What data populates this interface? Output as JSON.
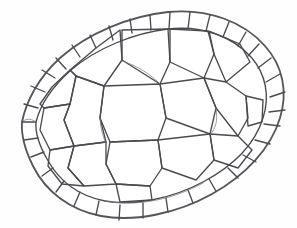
{
  "image": {
    "title": "Turtle shell carapace sketch",
    "subject": "turtle-carapace",
    "medium": "pencil drawing",
    "background_color": "#fefefe",
    "ink_color": "#4a4a4f",
    "outline_color": "#55555b",
    "width": 297,
    "height": 228,
    "caption": ""
  },
  "diagram": {
    "type": "line-drawing",
    "orientation": "dorsal view, pointed end at left",
    "outer_rim": {
      "name": "carapace-outline",
      "path": "M 22 122 C 26 102 38 78 60 58 C 88 33 130 16 168 12 C 208 8 244 22 265 46 C 283 66 288 92 280 118 C 271 148 246 175 212 194 C 176 214 134 222 101 216 C 70 210 46 192 33 166 C 25 150 21 136 22 122 Z"
    },
    "inner_rim": {
      "name": "marginal-inner-boundary",
      "path": "M 36 122 C 40 106 52 87 71 70 C 97 48 134 33 168 29 C 203 25 233 37 251 57 C 266 74 270 96 263 118 C 255 144 233 166 203 182 C 171 199 134 206 105 201 C 79 196 59 181 47 159 C 39 145 35 134 36 122 Z"
    },
    "marginal_scutes": {
      "label": "marginal scutes",
      "count": 27,
      "description": "ring of small quadrilateral plates around the rim"
    },
    "vertebral_scutes": {
      "label": "vertebral scutes",
      "count": 5,
      "description": "central row of large hexagonal plates running along the midline"
    },
    "costal_scutes": {
      "label": "costal scutes",
      "count": 8,
      "description": "four large plates on each flank between the vertebrals and the marginals"
    },
    "nuchal_scute": {
      "label": "nuchal scute",
      "count": 1
    }
  },
  "scute_paths": {
    "inner_plates": [
      "M 120 30 L 122 60 L 104 86 L 76 76 L 70 70 L 96 48 Z",
      "M 122 30 L 168 29 L 170 62 L 160 84 L 122 60 Z",
      "M 170 29 L 208 31 L 214 54 L 204 78 L 170 62 Z",
      "M 209 31 L 240 44 L 250 62 L 226 82 L 214 54 Z",
      "M 70 70 L 76 76 L 70 104 L 44 108 L 40 104 L 52 87 Z",
      "M 104 86 L 160 84 L 166 118 L 158 140 L 110 142 L 100 118 Z",
      "M 160 84 L 204 78 L 216 108 L 210 134 L 166 118 Z",
      "M 204 78 L 226 82 L 246 96 L 248 118 L 238 136 L 216 108 Z",
      "M 76 76 L 104 86 L 100 118 L 106 142 L 74 146 L 64 120 L 70 104 Z",
      "M 44 108 L 70 104 L 64 120 L 74 146 L 50 150 L 40 130 Z",
      "M 110 142 L 158 140 L 162 168 L 150 186 L 116 184 L 106 164 Z",
      "M 158 140 L 210 134 L 214 160 L 196 180 L 162 168 Z",
      "M 210 134 L 238 136 L 252 150 L 238 168 L 214 160 Z",
      "M 74 146 L 106 142 L 106 164 L 116 184 L 84 186 L 68 168 Z",
      "M 50 150 L 74 146 L 68 168 L 84 186 L 62 184 L 48 166 Z",
      "M 116 184 L 150 186 L 152 200 L 120 202 Z",
      "M 246 96 L 263 100 L 262 122 L 248 126 Z"
    ],
    "marginal_spokes": [
      "M 22 122 L 36 122",
      "M 24 104 L 38 108",
      "M 31 86 L 45 92",
      "M 42 70 L 55 78",
      "M 56 58 L 66 69",
      "M 72 45 L 80 57",
      "M 90 35 L 96 48",
      "M 109 26 L 113 40",
      "M 130 19 L 132 33",
      "M 150 15 L 151 30",
      "M 170 12 L 169 29",
      "M 190 12 L 188 29",
      "M 210 15 L 206 31",
      "M 229 22 L 223 37",
      "M 246 32 L 238 46",
      "M 259 44 L 248 56",
      "M 271 58 L 258 68",
      "M 280 74 L 266 82",
      "M 285 92 L 270 97",
      "M 285 110 L 269 112",
      "M 280 126 L 264 124",
      "M 270 144 L 255 140",
      "M 256 162 L 243 155",
      "M 238 178 L 228 168",
      "M 216 191 L 209 179",
      "M 193 203 L 188 190",
      "M 168 212 L 166 198",
      "M 143 218 L 143 203",
      "M 119 220 L 120 205",
      "M 96 215 L 99 201",
      "M 74 206 L 80 192",
      "M 56 192 L 64 181",
      "M 42 176 L 53 168",
      "M 31 157 L 44 152",
      "M 24 140 L 38 138"
    ]
  }
}
